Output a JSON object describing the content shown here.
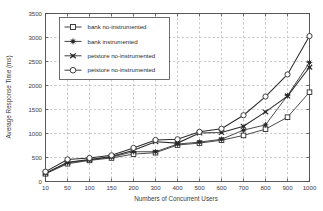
{
  "chart_data": {
    "type": "line",
    "title": "",
    "xlabel": "Numbers of Concurrent Users",
    "ylabel": "Average Response Time (ms)",
    "categories": [
      "10",
      "50",
      "100",
      "150",
      "200",
      "300",
      "400",
      "500",
      "600",
      "700",
      "800",
      "900",
      "1000"
    ],
    "xtick_labels": [
      "10",
      "50",
      "100",
      "150",
      "200",
      "300",
      "400",
      "500",
      "600",
      "700",
      "800",
      "900",
      "1000"
    ],
    "ytick_labels": [
      "0",
      "500",
      "1000",
      "1500",
      "2000",
      "2500",
      "3000",
      "3500"
    ],
    "ytick_values": [
      0,
      500,
      1000,
      1500,
      2000,
      2500,
      3000,
      3500
    ],
    "ylim": [
      0,
      3500
    ],
    "grid": true,
    "grid_style": "dashed",
    "legend_position": "upper-left-inside",
    "axis_scale": "categorical-x",
    "series": [
      {
        "name": "bank no-instrumented",
        "marker": "open-square",
        "color": "#2b2b2b",
        "values": [
          160,
          370,
          440,
          490,
          570,
          600,
          760,
          800,
          860,
          960,
          1090,
          1340,
          1860
        ]
      },
      {
        "name": "bank instrumented",
        "marker": "filled-asterisk",
        "color": "#2b2b2b",
        "values": [
          170,
          390,
          450,
          510,
          620,
          620,
          780,
          820,
          880,
          1070,
          1180,
          1790,
          2480
        ]
      },
      {
        "name": "petstore no-instrumented",
        "marker": "filled-x",
        "color": "#2b2b2b",
        "values": [
          175,
          400,
          460,
          520,
          650,
          830,
          800,
          1010,
          1020,
          1150,
          1450,
          1780,
          2380
        ]
      },
      {
        "name": "petstore no-instrumented",
        "marker": "open-circle",
        "color": "#2b2b2b",
        "values": [
          205,
          460,
          490,
          545,
          700,
          865,
          880,
          1035,
          1100,
          1380,
          1770,
          2230,
          3030
        ]
      }
    ]
  },
  "legend": {
    "entries": [
      {
        "label": "bank no-instrumented",
        "marker": "open-square"
      },
      {
        "label": "bank instrumented",
        "marker": "filled-asterisk"
      },
      {
        "label": "petstore no-instrumented",
        "marker": "filled-x"
      },
      {
        "label": "petstore no-instrumented",
        "marker": "open-circle"
      }
    ]
  },
  "colors": {
    "background": "#ffffff",
    "axis": "#4a4a4a",
    "grid": "#9a9a9a",
    "series": "#2b2b2b",
    "text": "#3c3c3c"
  }
}
